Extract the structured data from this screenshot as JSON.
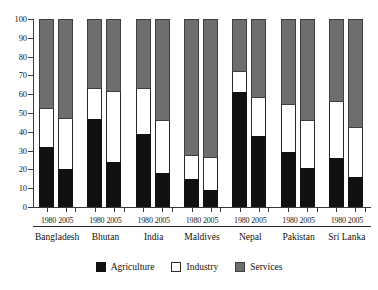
{
  "chart_data": {
    "type": "bar",
    "subtype": "stacked-bar-100-percent",
    "title": "",
    "subtitle": "",
    "xlabel": "",
    "ylabel": "",
    "ylim": [
      0,
      100
    ],
    "ytick_labels": [
      "0",
      "10",
      "20",
      "30",
      "40",
      "50",
      "60",
      "70",
      "80",
      "90",
      "100"
    ],
    "ytick_values": [
      0,
      10,
      20,
      30,
      40,
      50,
      60,
      70,
      80,
      90,
      100
    ],
    "grid": false,
    "legend_position": "bottom",
    "stack_order_bottom_to_top": [
      "Agriculture",
      "Industry",
      "Services"
    ],
    "categories": [
      "Bangladesh 1980",
      "Bangladesh 2005",
      "Bhutan 1980",
      "Bhutan 2005",
      "India 1980",
      "India 2005",
      "Maldives 1980",
      "Maldives 2005",
      "Nepal 1980",
      "Nepal 2005",
      "Pakistan 1980",
      "Pakistan 2005",
      "Sri Lanka 1980",
      "Sri Lanka 2005"
    ],
    "series": [
      {
        "name": "Agriculture",
        "color": "#111111",
        "values": [
          32,
          20,
          47,
          24,
          39,
          18,
          15,
          9,
          61,
          38,
          29,
          21,
          26,
          16
        ]
      },
      {
        "name": "Industry",
        "color": "#ffffff",
        "values": [
          20,
          27,
          16,
          37,
          24,
          28,
          12,
          17,
          11,
          20,
          25,
          25,
          30,
          26
        ]
      },
      {
        "name": "Services",
        "color": "#6e6e6e",
        "values": [
          48,
          53,
          37,
          39,
          37,
          54,
          73,
          74,
          28,
          42,
          46,
          54,
          44,
          58
        ]
      }
    ],
    "groups": [
      {
        "country": "Bangladesh",
        "years": [
          "1980",
          "2005"
        ],
        "bars": [
          {
            "year": "1980",
            "agriculture": 32,
            "industry": 20,
            "services": 48
          },
          {
            "year": "2005",
            "agriculture": 20,
            "industry": 27,
            "services": 53
          }
        ]
      },
      {
        "country": "Bhutan",
        "years": [
          "1980",
          "2005"
        ],
        "bars": [
          {
            "year": "1980",
            "agriculture": 47,
            "industry": 16,
            "services": 37
          },
          {
            "year": "2005",
            "agriculture": 24,
            "industry": 37,
            "services": 39
          }
        ]
      },
      {
        "country": "India",
        "years": [
          "1980",
          "2005"
        ],
        "bars": [
          {
            "year": "1980",
            "agriculture": 39,
            "industry": 24,
            "services": 37
          },
          {
            "year": "2005",
            "agriculture": 18,
            "industry": 28,
            "services": 54
          }
        ]
      },
      {
        "country": "Maldives",
        "years": [
          "1980",
          "2005"
        ],
        "bars": [
          {
            "year": "1980",
            "agriculture": 15,
            "industry": 12,
            "services": 73
          },
          {
            "year": "2005",
            "agriculture": 9,
            "industry": 17,
            "services": 74
          }
        ]
      },
      {
        "country": "Nepal",
        "years": [
          "1980",
          "2005"
        ],
        "bars": [
          {
            "year": "1980",
            "agriculture": 61,
            "industry": 11,
            "services": 28
          },
          {
            "year": "2005",
            "agriculture": 38,
            "industry": 20,
            "services": 42
          }
        ]
      },
      {
        "country": "Pakistan",
        "years": [
          "1980",
          "2005"
        ],
        "bars": [
          {
            "year": "1980",
            "agriculture": 29,
            "industry": 25,
            "services": 46
          },
          {
            "year": "2005",
            "agriculture": 21,
            "industry": 25,
            "services": 54
          }
        ]
      },
      {
        "country": "Sri Lanka",
        "years": [
          "1980",
          "2005"
        ],
        "bars": [
          {
            "year": "1980",
            "agriculture": 26,
            "industry": 30,
            "services": 44
          },
          {
            "year": "2005",
            "agriculture": 16,
            "industry": 26,
            "services": 58
          }
        ]
      }
    ],
    "legend": [
      {
        "label": "Agriculture",
        "swatch": "agriculture",
        "color": "#111111"
      },
      {
        "label": "Industry",
        "swatch": "industry",
        "color": "#ffffff"
      },
      {
        "label": "Services",
        "swatch": "services",
        "color": "#6e6e6e"
      }
    ]
  }
}
